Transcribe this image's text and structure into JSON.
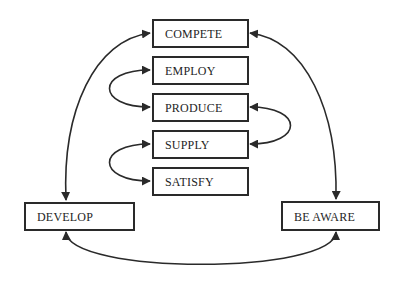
{
  "diagram": {
    "type": "cycle",
    "colors": {
      "stroke": "#2a2a2a",
      "text": "#1e1e1e",
      "background": "#ffffff"
    },
    "nodes": [
      {
        "id": "compete",
        "label": "COMPETE"
      },
      {
        "id": "employ",
        "label": "EMPLOY"
      },
      {
        "id": "produce",
        "label": "PRODUCE"
      },
      {
        "id": "supply",
        "label": "SUPPLY"
      },
      {
        "id": "satisfy",
        "label": "SATISFY"
      },
      {
        "id": "develop",
        "label": "DEVELOP"
      },
      {
        "id": "be_aware",
        "label": "BE AWARE"
      }
    ],
    "edges": [
      {
        "from": "compete",
        "to": "develop",
        "direction": "both"
      },
      {
        "from": "compete",
        "to": "be_aware",
        "direction": "both"
      },
      {
        "from": "employ",
        "to": "produce",
        "direction": "both"
      },
      {
        "from": "produce",
        "to": "supply",
        "direction": "both"
      },
      {
        "from": "supply",
        "to": "satisfy",
        "direction": "both"
      },
      {
        "from": "develop",
        "to": "be_aware",
        "direction": "both"
      }
    ]
  }
}
